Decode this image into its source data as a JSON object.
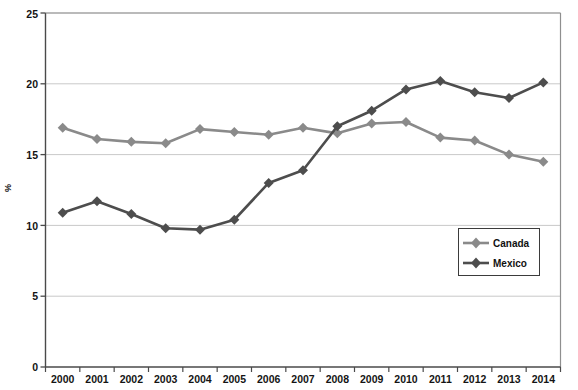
{
  "chart_data": {
    "type": "line",
    "title": "",
    "subtitle": "",
    "xlabel": "",
    "ylabel": "%",
    "x": [
      1999,
      2000,
      2001,
      2002,
      2003,
      2004,
      2005,
      2006,
      2007,
      2008,
      2009,
      2010,
      2011,
      2012,
      2013
    ],
    "categories": [
      "2000",
      "2001",
      "2002",
      "2003",
      "2004",
      "2005",
      "2006",
      "2007",
      "2008",
      "2009",
      "2010",
      "2011",
      "2012",
      "2013",
      "2014"
    ],
    "xtick_labels": [
      "2000",
      "2001",
      "2002",
      "2003",
      "2004",
      "2005",
      "2006",
      "2007",
      "2008",
      "2009",
      "2010",
      "2011",
      "2012",
      "2013",
      "2014"
    ],
    "ytick_labels": [
      "0",
      "5",
      "10",
      "15",
      "20",
      "25"
    ],
    "yticks": [
      0,
      5,
      10,
      15,
      20,
      25
    ],
    "ylim": [
      0,
      25
    ],
    "xlim": [
      1999,
      2014
    ],
    "grid": true,
    "grid_axis": "y",
    "legend_position": "center-right",
    "series": [
      {
        "name": "Canada",
        "color": "#8a8a8a",
        "marker": "diamond",
        "values": [
          16.9,
          16.1,
          15.9,
          15.8,
          16.8,
          16.6,
          16.4,
          16.9,
          16.5,
          17.2,
          17.3,
          16.2,
          16.0,
          15.0,
          14.5
        ]
      },
      {
        "name": "Mexico",
        "color": "#4d4d4d",
        "marker": "diamond",
        "values": [
          10.9,
          11.7,
          10.8,
          9.8,
          9.7,
          10.4,
          13.0,
          13.9,
          17.0,
          18.1,
          19.6,
          20.2,
          19.4,
          19.0,
          20.1
        ]
      }
    ]
  },
  "legend": {
    "entries": [
      {
        "label": "Canada"
      },
      {
        "label": "Mexico"
      }
    ]
  },
  "axes": {
    "y_title": "%"
  }
}
